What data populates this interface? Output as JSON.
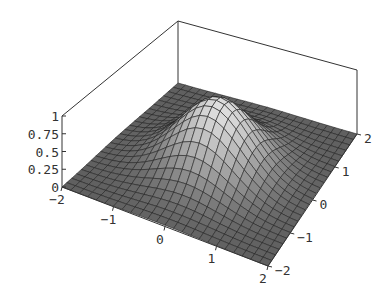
{
  "chart_data": {
    "type": "surface3d",
    "title": "",
    "function": "z = exp(-(x^2 + y^2))",
    "x_range": [
      -2,
      2
    ],
    "y_range": [
      -2,
      2
    ],
    "z_range": [
      0,
      1
    ],
    "grid_steps": 24,
    "x_ticks": [
      -2,
      -1,
      0,
      1,
      2
    ],
    "x_tick_labels": [
      "−2",
      "−1",
      "0",
      "1",
      "2"
    ],
    "y_ticks": [
      -2,
      -1,
      0,
      1,
      2
    ],
    "y_tick_labels": [
      "−2",
      "−1",
      "0",
      "1",
      "2"
    ],
    "z_ticks": [
      0,
      0.25,
      0.5,
      0.75,
      1
    ],
    "z_tick_labels": [
      "0",
      "0.25",
      "0.5",
      "0.75",
      "1"
    ],
    "xlabel": "",
    "ylabel": "",
    "zlabel": "",
    "boxed": true,
    "mesh": true,
    "shading": "grayscale"
  },
  "projection": {
    "corner_front_left": [
      62,
      187
    ],
    "corner_front": [
      268,
      266
    ],
    "corner_right": [
      357,
      134
    ],
    "corner_back": [
      178,
      83
    ],
    "z_scale_front_left": 71,
    "z_scale_front": 72,
    "z_scale_right": 64,
    "z_scale_back": 62
  },
  "colors": {
    "line": "#222222",
    "box": "#333333",
    "label": "#333333",
    "low": "#3a3a3a",
    "high": "#e8e8e8"
  }
}
